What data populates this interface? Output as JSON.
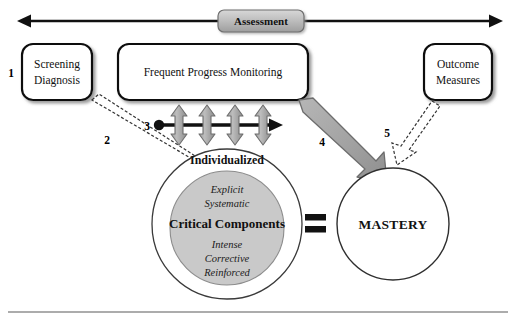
{
  "figure": {
    "title": "Assessment",
    "banner_label": "Assessment"
  },
  "boxes": [
    {
      "id": "screening-diagnosis",
      "number": "1",
      "line1": "Screening",
      "line2": "Diagnosis"
    },
    {
      "id": "frequent-progress-monitoring",
      "number": "3",
      "line1": "Frequent Progress Monitoring",
      "line2": ""
    },
    {
      "id": "outcome-measures",
      "number": "5",
      "line1": "Outcome",
      "line2": "Measures"
    }
  ],
  "connectors": [
    {
      "id": "arrow-2",
      "number": "2"
    },
    {
      "id": "arrow-3",
      "number": "3"
    },
    {
      "id": "arrow-4",
      "number": "4"
    },
    {
      "id": "arrow-5",
      "number": "5"
    }
  ],
  "instruction_circle": {
    "outer_label": "Individualized",
    "inner_top_1": "Explicit",
    "inner_top_2": "Systematic",
    "inner_center": "Critical Components",
    "inner_bottom_1": "Intense",
    "inner_bottom_2": "Corrective",
    "inner_bottom_3": "Reinforced"
  },
  "equals_sign": "=",
  "mastery_circle": {
    "label": "MASTERY"
  },
  "colors": {
    "outline": "#111111",
    "gray_arrow_fill": "#a9a9a9",
    "gray_arrow_stroke": "#6e6e6e",
    "inner_circle_fill": "#c9c9c9",
    "banner_fill": "#bdbdbd",
    "white": "#ffffff",
    "rule": "#5a5a5a"
  }
}
